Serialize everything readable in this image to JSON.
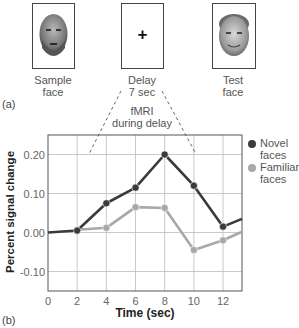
{
  "panel_a": {
    "label": "(a)",
    "sample": {
      "caption_line1": "Sample",
      "caption_line2": "face"
    },
    "delay": {
      "caption_line1": "Delay",
      "caption_line2": "7 sec",
      "symbol": "+"
    },
    "test": {
      "caption_line1": "Test",
      "caption_line2": "face"
    },
    "fmri_note": {
      "line1": "fMRI",
      "line2": "during delay"
    }
  },
  "panel_b": {
    "label": "(b)"
  },
  "colors": {
    "novel": "#3a3a3a",
    "familiar": "#a8a8a8",
    "grid": "#bdbdbd",
    "axis": "#555555"
  },
  "chart_data": {
    "type": "line",
    "title": "",
    "xlabel": "Time (sec)",
    "ylabel": "Percent signal change",
    "x": [
      0,
      2,
      4,
      6,
      8,
      10,
      12
    ],
    "xticks": [
      "0",
      "2",
      "4",
      "6",
      "8",
      "10",
      "12"
    ],
    "yticks": [
      "0.20",
      "0.10",
      "0.00",
      "-0.10"
    ],
    "xlim": [
      0,
      13.3
    ],
    "ylim": [
      -0.15,
      0.25
    ],
    "grid": true,
    "legend_position": "right",
    "series": [
      {
        "name": "Novel faces",
        "legend_line1": "Novel",
        "legend_line2": "faces",
        "values": [
          0.0,
          0.005,
          0.075,
          0.115,
          0.2,
          0.12,
          0.015
        ],
        "marked_from_index": 1,
        "tail_end": 0.035
      },
      {
        "name": "Familiar faces",
        "legend_line1": "Familiar",
        "legend_line2": "faces",
        "values": [
          null,
          0.007,
          0.012,
          0.065,
          0.063,
          -0.045,
          -0.02
        ],
        "marked_from_index": 1,
        "tail_end": 0.002
      }
    ],
    "annotations": [
      "fMRI during delay"
    ]
  }
}
